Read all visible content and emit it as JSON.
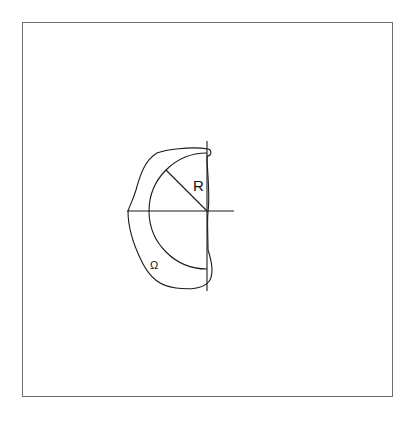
{
  "diagram": {
    "type": "geometric-domain",
    "labels": {
      "radius": "R",
      "domain": "Ω"
    },
    "elements": [
      {
        "kind": "frame",
        "description": "rectangular border around figure"
      },
      {
        "kind": "axis",
        "orientation": "vertical"
      },
      {
        "kind": "axis",
        "orientation": "horizontal"
      },
      {
        "kind": "semicircle",
        "description": "left half-disk of radius R centered at origin"
      },
      {
        "kind": "radius-segment",
        "label": "R"
      },
      {
        "kind": "closed-curve",
        "label": "Ω",
        "description": "domain boundary enclosing the half-disk"
      }
    ],
    "colors": {
      "stroke": "#1a1a1a",
      "frame": "#6e6e6e",
      "background": "#ffffff"
    }
  }
}
